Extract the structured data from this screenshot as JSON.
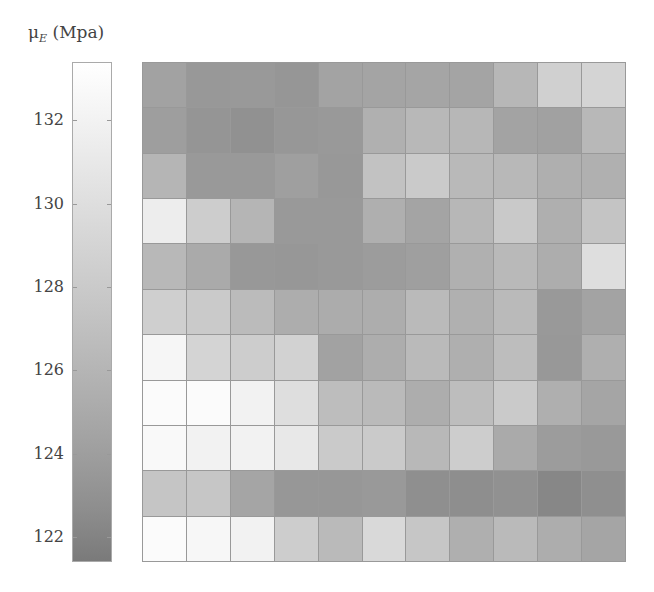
{
  "chart_data": {
    "type": "heatmap",
    "title": "",
    "colorbar": {
      "label": "μ",
      "label_sub": "E",
      "label_unit": "(Mpa)",
      "ticks": [
        132,
        130,
        128,
        126,
        124,
        122
      ],
      "range": [
        121.4,
        133.4
      ],
      "colormap": "gray (low = dark gray, high = white)",
      "color_low": "#7a7a7a",
      "color_high": "#ffffff"
    },
    "rows": 11,
    "cols": 11,
    "xlabel": "",
    "ylabel": "",
    "grid": true,
    "values": [
      [
        124.3,
        123.5,
        123.6,
        123.3,
        124.4,
        124.5,
        124.6,
        124.5,
        126.2,
        128.6,
        129.0
      ],
      [
        124.0,
        123.2,
        122.9,
        123.4,
        123.6,
        125.6,
        126.3,
        126.2,
        124.4,
        124.2,
        126.3
      ],
      [
        126.0,
        123.6,
        123.6,
        124.1,
        123.5,
        127.2,
        128.0,
        126.4,
        126.3,
        125.5,
        125.6
      ],
      [
        131.5,
        128.3,
        126.0,
        123.6,
        123.6,
        125.5,
        124.5,
        126.2,
        127.9,
        125.5,
        127.4
      ],
      [
        126.3,
        125.0,
        123.5,
        123.4,
        123.6,
        123.8,
        124.1,
        125.6,
        126.4,
        125.3,
        130.0
      ],
      [
        128.5,
        128.0,
        126.6,
        125.3,
        125.2,
        125.3,
        126.5,
        125.6,
        126.5,
        123.6,
        124.4
      ],
      [
        132.5,
        129.0,
        128.3,
        128.8,
        124.3,
        125.3,
        126.5,
        125.5,
        126.8,
        123.5,
        125.5
      ],
      [
        133.0,
        133.0,
        132.0,
        130.0,
        126.8,
        126.5,
        125.3,
        126.8,
        128.0,
        125.5,
        124.6
      ],
      [
        132.8,
        132.0,
        132.0,
        131.0,
        128.0,
        128.0,
        126.3,
        128.3,
        125.0,
        123.8,
        123.6
      ],
      [
        127.5,
        127.6,
        124.6,
        123.4,
        123.4,
        123.6,
        122.8,
        122.7,
        122.9,
        122.2,
        122.8
      ],
      [
        133.0,
        132.6,
        132.0,
        128.3,
        126.5,
        129.5,
        127.6,
        125.5,
        126.5,
        125.3,
        124.6
      ]
    ]
  }
}
